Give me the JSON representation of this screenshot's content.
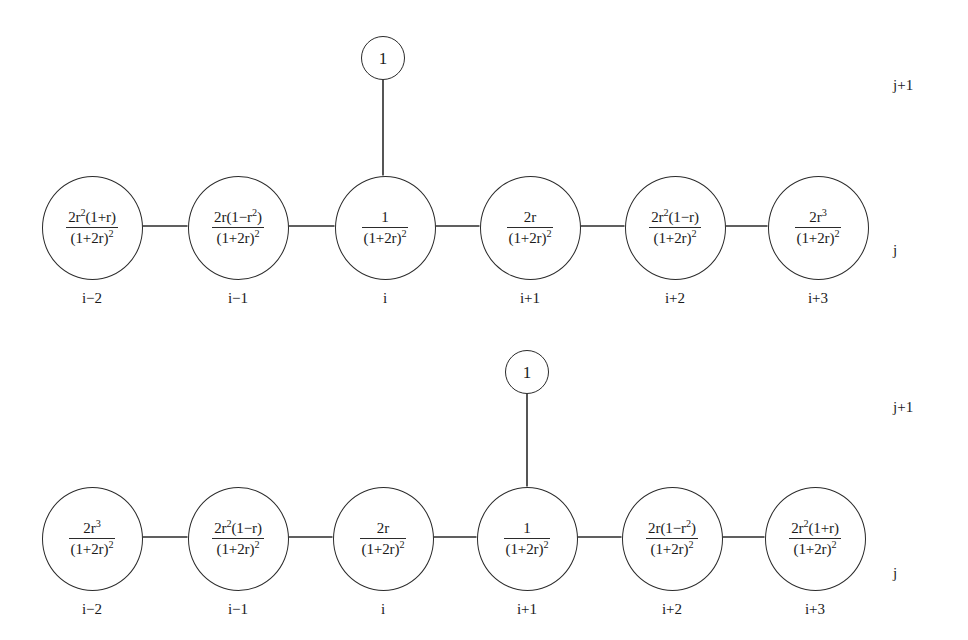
{
  "figure": {
    "type": "two-row chain graph of labelled nodes",
    "node_diameter_px": 101,
    "pendant_diameter_px": 44
  },
  "rows": [
    {
      "id": "top-row",
      "row_label_upper": "j+1",
      "row_label_lower": "j",
      "pendant": {
        "label": "1",
        "attached_to_index": 2,
        "cx": 383,
        "cy": 58
      },
      "nodes": [
        {
          "index_label": "i−2",
          "cx": 92,
          "numerator": "2r²(1+r)",
          "num_base": "2r",
          "num_sup": "2",
          "num_tail": "(1+r)",
          "denominator": "(1+2r)²",
          "den_base": "(1+2r)",
          "den_sup": "2"
        },
        {
          "index_label": "i−1",
          "cx": 238,
          "numerator": "2r(1−r²)",
          "num_base": "2r(1−r",
          "num_sup": "2",
          "num_tail": ")",
          "denominator": "(1+2r)²",
          "den_base": "(1+2r)",
          "den_sup": "2"
        },
        {
          "index_label": "i",
          "cx": 385,
          "numerator": "1",
          "num_base": "1",
          "num_sup": "",
          "num_tail": "",
          "denominator": "(1+2r)²",
          "den_base": "(1+2r)",
          "den_sup": "2"
        },
        {
          "index_label": "i+1",
          "cx": 530,
          "numerator": "2r",
          "num_base": "2r",
          "num_sup": "",
          "num_tail": "",
          "denominator": "(1+2r)²",
          "den_base": "(1+2r)",
          "den_sup": "2"
        },
        {
          "index_label": "i+2",
          "cx": 675,
          "numerator": "2r²(1−r)",
          "num_base": "2r",
          "num_sup": "2",
          "num_tail": "(1−r)",
          "denominator": "(1+2r)²",
          "den_base": "(1+2r)",
          "den_sup": "2"
        },
        {
          "index_label": "i+3",
          "cx": 818,
          "numerator": "2r³",
          "num_base": "2r",
          "num_sup": "3",
          "num_tail": "",
          "denominator": "(1+2r)²",
          "den_base": "(1+2r)",
          "den_sup": "2"
        }
      ]
    },
    {
      "id": "bottom-row",
      "row_label_upper": "j+1",
      "row_label_lower": "j",
      "pendant": {
        "label": "1",
        "attached_to_index": 3,
        "cx": 527,
        "cy": 372
      },
      "nodes": [
        {
          "index_label": "i−2",
          "cx": 92,
          "numerator": "2r³",
          "num_base": "2r",
          "num_sup": "3",
          "num_tail": "",
          "denominator": "(1+2r)²",
          "den_base": "(1+2r)",
          "den_sup": "2"
        },
        {
          "index_label": "i−1",
          "cx": 238,
          "numerator": "2r²(1−r)",
          "num_base": "2r",
          "num_sup": "2",
          "num_tail": "(1−r)",
          "denominator": "(1+2r)²",
          "den_base": "(1+2r)",
          "den_sup": "2"
        },
        {
          "index_label": "i",
          "cx": 383,
          "numerator": "2r",
          "num_base": "2r",
          "num_sup": "",
          "num_tail": "",
          "denominator": "(1+2r)²",
          "den_base": "(1+2r)",
          "den_sup": "2"
        },
        {
          "index_label": "i+1",
          "cx": 527,
          "numerator": "1",
          "num_base": "1",
          "num_sup": "",
          "num_tail": "",
          "denominator": "(1+2r)²",
          "den_base": "(1+2r)",
          "den_sup": "2"
        },
        {
          "index_label": "i+2",
          "cx": 672,
          "numerator": "2r(1−r²)",
          "num_base": "2r(1−r",
          "num_sup": "2",
          "num_tail": ")",
          "denominator": "(1+2r)²",
          "den_base": "(1+2r)",
          "den_sup": "2"
        },
        {
          "index_label": "i+3",
          "cx": 815,
          "numerator": "2r²(1+r)",
          "num_base": "2r",
          "num_sup": "2",
          "num_tail": "(1+r)",
          "denominator": "(1+2r)²",
          "den_base": "(1+2r)",
          "den_sup": "2"
        }
      ]
    }
  ],
  "colors": {
    "stroke": "#2b2b2b",
    "background": "#ffffff",
    "text": "#1a1a1a"
  }
}
